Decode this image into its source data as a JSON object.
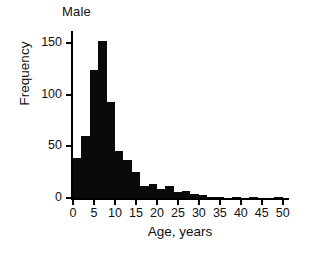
{
  "chart_data": {
    "type": "bar",
    "title": "Male",
    "xlabel": "Age, years",
    "ylabel": "Frequency",
    "xlim": [
      0,
      51
    ],
    "ylim": [
      0,
      160
    ],
    "grid": false,
    "legend": null,
    "bin_width": 2,
    "xticks": [
      0,
      5,
      10,
      15,
      20,
      25,
      30,
      35,
      40,
      45,
      50
    ],
    "xtick_labels": [
      "0",
      "5",
      "10",
      "15",
      "20",
      "25",
      "30",
      "35",
      "40",
      "45",
      "50"
    ],
    "yticks": [
      0,
      50,
      100,
      150
    ],
    "ytick_labels": [
      "0",
      "50",
      "100",
      "150"
    ],
    "bin_starts": [
      0,
      2,
      4,
      6,
      8,
      10,
      12,
      14,
      16,
      18,
      20,
      22,
      24,
      26,
      28,
      30,
      32,
      34,
      36,
      38,
      40,
      42,
      44,
      46,
      48
    ],
    "categories": [
      "0-2",
      "2-4",
      "4-6",
      "6-8",
      "8-10",
      "10-12",
      "12-14",
      "14-16",
      "16-18",
      "18-20",
      "20-22",
      "22-24",
      "24-26",
      "26-28",
      "28-30",
      "30-32",
      "32-34",
      "34-36",
      "36-38",
      "38-40",
      "40-42",
      "42-44",
      "44-46",
      "46-48",
      "48-50"
    ],
    "values": [
      39,
      60,
      124,
      152,
      93,
      46,
      37,
      25,
      12,
      14,
      9,
      12,
      6,
      7,
      4,
      3,
      1,
      1,
      0,
      1,
      0,
      1,
      0,
      0,
      1
    ],
    "bar_color": "#0a0a0a",
    "axis_color": "#000000",
    "background": "#ffffff"
  },
  "chart": {
    "title": "Male",
    "xlabel": "Age, years",
    "ylabel": "Frequency"
  }
}
